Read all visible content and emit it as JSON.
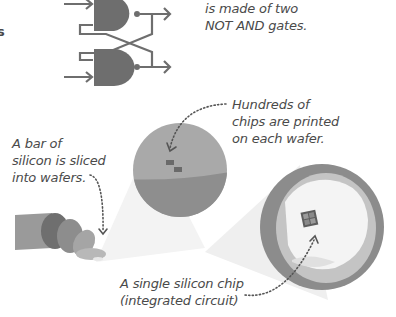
{
  "diagram": {
    "edge_fragment": "s",
    "latch_caption": [
      "is made of two",
      "NOT AND gates."
    ],
    "wafer_caption": [
      "Hundreds of",
      "chips are printed",
      "on each wafer."
    ],
    "bar_caption": [
      "A bar of",
      "silicon is sliced",
      "into wafers."
    ],
    "chip_caption": [
      "A single silicon chip",
      "(integrated circuit)"
    ],
    "components": [
      "NAND gate latch",
      "silicon bar",
      "wafers",
      "wafer with chips",
      "magnified wafer",
      "single chip"
    ],
    "colors": {
      "gate": "#6e6e6e",
      "wire": "#6e6e6e",
      "wafer_top": "#a7a7a7",
      "wafer_bottom": "#8d8d8d",
      "chip": "#5e5e5e",
      "beam": "#f0f0f0",
      "text": "#4a4a4a"
    }
  }
}
